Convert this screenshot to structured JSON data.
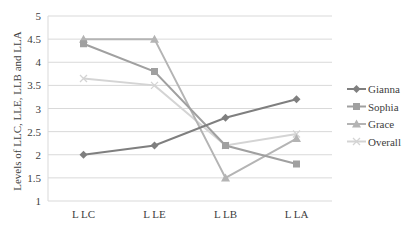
{
  "chart_data": {
    "type": "line",
    "title": "",
    "xlabel": "",
    "ylabel": "Levels of LLC, LLE, LLB and LLA",
    "categories": [
      "L LC",
      "L LE",
      "L LB",
      "L LA"
    ],
    "ylim": [
      1,
      5
    ],
    "yticks": [
      1,
      1.5,
      2,
      2.5,
      3,
      3.5,
      4,
      4.5,
      5
    ],
    "ytick_labels": [
      "1",
      "1.5",
      "2",
      "2.5",
      "3",
      "3.5",
      "4",
      "4.5",
      "5"
    ],
    "grid": true,
    "legend": "right",
    "series": [
      {
        "name": "Gianna",
        "values": [
          2.0,
          2.2,
          2.8,
          3.2
        ],
        "color": "#7f7f7f",
        "marker": "diamond"
      },
      {
        "name": "Sophia",
        "values": [
          4.4,
          3.8,
          2.2,
          1.8
        ],
        "color": "#a0a0a0",
        "marker": "square"
      },
      {
        "name": "Grace",
        "values": [
          4.5,
          4.5,
          1.5,
          2.35
        ],
        "color": "#b4b4b4",
        "marker": "triangle"
      },
      {
        "name": "Overall",
        "values": [
          3.65,
          3.5,
          2.2,
          2.45
        ],
        "color": "#d4d4d4",
        "marker": "x"
      }
    ]
  }
}
